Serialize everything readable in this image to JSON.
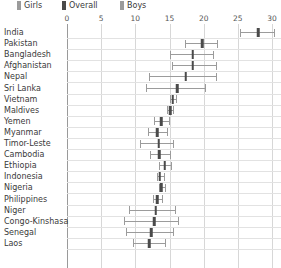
{
  "legend": {
    "items": [
      {
        "label": "Girls",
        "color": "#9b9b9b"
      },
      {
        "label": "Overall",
        "color": "#4a4a4a"
      },
      {
        "label": "Boys",
        "color": "#9b9b9b"
      }
    ]
  },
  "chart_data": {
    "type": "scatter",
    "title": "",
    "subtitle": "",
    "xlabel": "",
    "ylabel": "",
    "xlim": [
      0,
      30
    ],
    "xticks": [
      0,
      5,
      10,
      15,
      20,
      25,
      30
    ],
    "xticklabels": [
      "0",
      "5",
      "10",
      "15",
      "20",
      "25",
      "30"
    ],
    "grid": true,
    "legend_position": "top-left",
    "categories": [
      "India",
      "Pakistan",
      "Bangladesh",
      "Afghanistan",
      "Nepal",
      "Sri Lanka",
      "Vietnam",
      "Maldives",
      "Yemen",
      "Myanmar",
      "Timor-Leste",
      "Cambodia",
      "Ethiopia",
      "Indonesia",
      "Nigeria",
      "Philippines",
      "Niger",
      "Congo-Kinshasa",
      "Senegal",
      "Laos"
    ],
    "series": [
      {
        "name": "Girls",
        "values": [
          25.3,
          17.3,
          15.1,
          15.4,
          12.0,
          11.6,
          15.0,
          14.7,
          12.8,
          11.9,
          10.7,
          12.2,
          13.5,
          13.1,
          13.4,
          12.6,
          9.0,
          8.3,
          8.6,
          9.6
        ]
      },
      {
        "name": "Overall",
        "values": [
          28.0,
          19.8,
          18.4,
          18.4,
          17.4,
          16.1,
          15.5,
          15.1,
          13.8,
          13.2,
          13.4,
          13.5,
          14.3,
          13.6,
          13.8,
          13.2,
          13.0,
          12.8,
          12.3,
          12.0
        ]
      },
      {
        "name": "Boys",
        "values": [
          30.3,
          22.0,
          21.4,
          21.8,
          21.8,
          20.2,
          16.0,
          15.5,
          14.9,
          14.6,
          15.5,
          15.1,
          15.2,
          14.2,
          14.4,
          13.9,
          15.8,
          16.3,
          15.5,
          14.4
        ]
      }
    ]
  }
}
